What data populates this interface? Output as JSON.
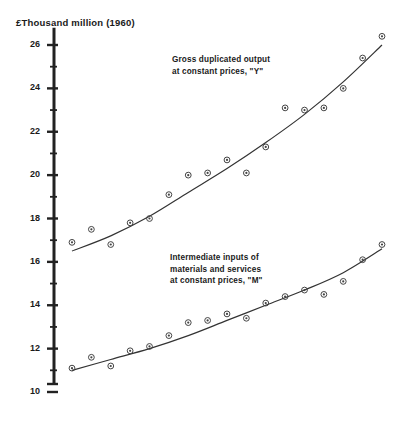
{
  "chart_data": {
    "type": "scatter",
    "title": "",
    "ylabel": "£Thousand million (1960)",
    "xlabel": "",
    "ylim": [
      10,
      26.8
    ],
    "y_ticks_major": [
      10,
      12,
      14,
      16,
      18,
      20,
      22,
      24,
      26
    ],
    "y_ticks_minor": [
      11,
      13,
      15,
      17,
      19,
      21,
      23,
      25
    ],
    "grid": false,
    "legend_position": "inline-annotation",
    "axis_color": "#222222",
    "marker_color": "#444444",
    "curve_color": "#333333",
    "series": [
      {
        "name": "Gross duplicated output at constant prices, \"Y\"",
        "annotation_lines": [
          "Gross duplicated output",
          "at constant prices, \"Y\""
        ],
        "points": [
          {
            "x": 0,
            "y": 16.9
          },
          {
            "x": 1,
            "y": 17.5
          },
          {
            "x": 2,
            "y": 16.8
          },
          {
            "x": 3,
            "y": 17.8
          },
          {
            "x": 4,
            "y": 18.0
          },
          {
            "x": 5,
            "y": 19.1
          },
          {
            "x": 6,
            "y": 20.0
          },
          {
            "x": 7,
            "y": 20.1
          },
          {
            "x": 8,
            "y": 20.7
          },
          {
            "x": 9,
            "y": 20.1
          },
          {
            "x": 10,
            "y": 21.3
          },
          {
            "x": 11,
            "y": 23.1
          },
          {
            "x": 12,
            "y": 23.0
          },
          {
            "x": 13,
            "y": 23.1
          },
          {
            "x": 14,
            "y": 24.0
          },
          {
            "x": 15,
            "y": 25.4
          },
          {
            "x": 16,
            "y": 26.4
          }
        ],
        "fit_curve": [
          {
            "x": 0,
            "y": 16.5
          },
          {
            "x": 2,
            "y": 17.2
          },
          {
            "x": 4,
            "y": 18.1
          },
          {
            "x": 6,
            "y": 19.2
          },
          {
            "x": 8,
            "y": 20.3
          },
          {
            "x": 10,
            "y": 21.5
          },
          {
            "x": 12,
            "y": 22.8
          },
          {
            "x": 14,
            "y": 24.3
          },
          {
            "x": 16,
            "y": 26.0
          }
        ]
      },
      {
        "name": "Intermediate inputs of materials and services at constant prices, \"M\"",
        "annotation_lines": [
          "Intermediate inputs of",
          "materials and services",
          "at constant prices, \"M\""
        ],
        "points": [
          {
            "x": 0,
            "y": 11.1
          },
          {
            "x": 1,
            "y": 11.6
          },
          {
            "x": 2,
            "y": 11.2
          },
          {
            "x": 3,
            "y": 11.9
          },
          {
            "x": 4,
            "y": 12.1
          },
          {
            "x": 5,
            "y": 12.6
          },
          {
            "x": 6,
            "y": 13.2
          },
          {
            "x": 7,
            "y": 13.3
          },
          {
            "x": 8,
            "y": 13.6
          },
          {
            "x": 9,
            "y": 13.4
          },
          {
            "x": 10,
            "y": 14.1
          },
          {
            "x": 11,
            "y": 14.4
          },
          {
            "x": 12,
            "y": 14.7
          },
          {
            "x": 13,
            "y": 14.5
          },
          {
            "x": 14,
            "y": 15.1
          },
          {
            "x": 15,
            "y": 16.1
          },
          {
            "x": 16,
            "y": 16.8
          }
        ],
        "fit_curve": [
          {
            "x": 0,
            "y": 11.0
          },
          {
            "x": 2,
            "y": 11.5
          },
          {
            "x": 4,
            "y": 12.0
          },
          {
            "x": 6,
            "y": 12.6
          },
          {
            "x": 8,
            "y": 13.3
          },
          {
            "x": 10,
            "y": 14.0
          },
          {
            "x": 12,
            "y": 14.7
          },
          {
            "x": 14,
            "y": 15.5
          },
          {
            "x": 16,
            "y": 16.6
          }
        ]
      }
    ]
  }
}
